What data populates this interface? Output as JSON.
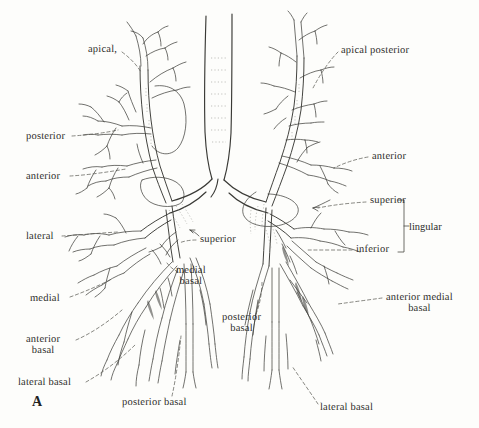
{
  "figure": {
    "panel_mark": "A",
    "left_lung_labels": [
      {
        "id": "apical",
        "text": "apical,",
        "x": 88,
        "y": 45
      },
      {
        "id": "posterior",
        "text": "posterior",
        "x": 26,
        "y": 132
      },
      {
        "id": "anterior",
        "text": "anterior",
        "x": 26,
        "y": 172
      },
      {
        "id": "lateral",
        "text": "lateral",
        "x": 26,
        "y": 232
      },
      {
        "id": "medial",
        "text": "medial",
        "x": 30,
        "y": 294
      },
      {
        "id": "anterior-basal",
        "text": "anterior\nbasal",
        "x": 26,
        "y": 338
      },
      {
        "id": "lateral-basal",
        "text": "lateral basal",
        "x": 18,
        "y": 383
      },
      {
        "id": "posterior-basal",
        "text": "posterior basal",
        "x": 122,
        "y": 398
      },
      {
        "id": "superior",
        "text": "superior",
        "x": 200,
        "y": 238
      },
      {
        "id": "medial-basal",
        "text": "medial\nbasal",
        "x": 178,
        "y": 268
      }
    ],
    "right_lung_labels": [
      {
        "id": "apical-posterior",
        "text": "apical posterior",
        "x": 341,
        "y": 46
      },
      {
        "id": "anterior-r",
        "text": "anterior",
        "x": 370,
        "y": 153
      },
      {
        "id": "superior-r",
        "text": "superior",
        "x": 370,
        "y": 198
      },
      {
        "id": "inferior-r",
        "text": "inferior",
        "x": 356,
        "y": 248
      },
      {
        "id": "anterior-medial-basal",
        "text": "anterior medial\nbasal",
        "x": 386,
        "y": 294
      },
      {
        "id": "lateral-basal-r",
        "text": "lateral basal",
        "x": 320,
        "y": 403
      },
      {
        "id": "posterior-basal-r",
        "text": "posterior\nbasal",
        "x": 224,
        "y": 313
      }
    ],
    "bracket": {
      "label": "lingular",
      "label_x": 408,
      "label_y": 226,
      "x": 400,
      "y_top": 200,
      "y_bottom": 252
    },
    "colors": {
      "ink": "#2b2b28",
      "line": "#3a3a36",
      "paper": "#fdfdfb",
      "faint": "#9a9a93"
    }
  }
}
